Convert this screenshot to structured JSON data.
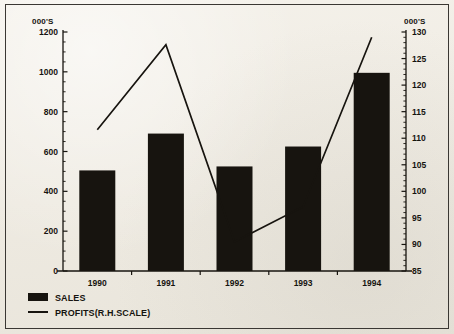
{
  "chart_data": {
    "type": "bar",
    "title": "",
    "subtitle": "",
    "xlabel": "",
    "ylabel": "000'S",
    "y2label": "000'S",
    "categories": [
      "1990",
      "1991",
      "1992",
      "1993",
      "1994"
    ],
    "grid": false,
    "legend_position": "bottom-left",
    "ylim": [
      0,
      1200
    ],
    "yticks": [
      0,
      200,
      400,
      600,
      800,
      1000,
      1200
    ],
    "ytick_labels": [
      "0",
      "200",
      "400",
      "600",
      "800",
      "1000",
      "1200"
    ],
    "y2lim": [
      85,
      130
    ],
    "y2ticks": [
      85,
      90,
      95,
      100,
      105,
      110,
      115,
      120,
      125,
      130
    ],
    "y2tick_labels": [
      "85",
      "90",
      "95",
      "100",
      "105",
      "110",
      "115",
      "120",
      "125",
      "130"
    ],
    "series": [
      {
        "name": "SALES",
        "type": "bar",
        "axis": "left",
        "color": "#17140f",
        "values": [
          505,
          690,
          525,
          625,
          995
        ]
      },
      {
        "name": "PROFITS(R.H.SCALE)",
        "type": "line",
        "axis": "right",
        "color": "#17140f",
        "values": [
          111.6,
          127.6,
          90.5,
          97.1,
          129.0
        ]
      }
    ]
  },
  "legend": {
    "items": [
      {
        "label": "SALES",
        "marker": "filled-rect"
      },
      {
        "label": "PROFITS(R.H.SCALE)",
        "marker": "line"
      }
    ]
  },
  "axes": {
    "left_unit": "000'S",
    "right_unit": "000'S"
  }
}
